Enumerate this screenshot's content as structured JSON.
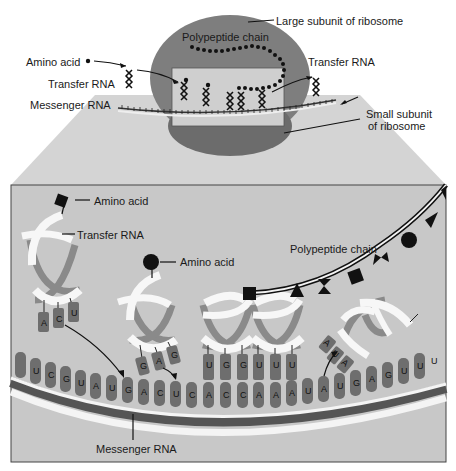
{
  "overview": {
    "labels": {
      "large_subunit": "Large subunit of ribosome",
      "polypeptide_chain": "Polypeptide chain",
      "amino_acid": "Amino acid",
      "transfer_rna_left": "Transfer RNA",
      "transfer_rna_right": "Transfer RNA",
      "messenger_rna": "Messenger RNA",
      "small_subunit_line1": "Small subunit",
      "small_subunit_line2": "of ribosome"
    }
  },
  "detail": {
    "labels": {
      "amino_acid_1": "Amino acid",
      "transfer_rna": "Transfer RNA",
      "amino_acid_2": "Amino acid",
      "polypeptide_chain": "Polypeptide chain",
      "messenger_rna": "Messenger RNA"
    },
    "trna_incoming_1": {
      "anticodon": [
        "A",
        "C",
        "U"
      ],
      "amino_acid_shape": "square"
    },
    "trna_incoming_2": {
      "anticodon": [
        "G",
        "A",
        "G"
      ],
      "amino_acid_shape": "circle"
    },
    "trna_bound_1": {
      "anticodon": [
        "U",
        "G",
        "G"
      ],
      "amino_acid_shape": "square"
    },
    "trna_bound_2": {
      "anticodon": [
        "U",
        "U",
        "U"
      ],
      "amino_acid_shape": "triangle"
    },
    "trna_exiting": {
      "anticodon": [
        "A",
        "U",
        "A"
      ]
    },
    "mrna_bases": [
      "U",
      "C",
      "G",
      "U",
      "A",
      "U",
      "G",
      "A",
      "C",
      "U",
      "C",
      "A",
      "C",
      "C",
      "A",
      "A",
      "A",
      "U",
      "A",
      "U",
      "G",
      "A",
      "G",
      "U",
      "U",
      "U"
    ],
    "polypeptide_residues": [
      "square",
      "triangle",
      "bowtie",
      "square",
      "bowtie",
      "circle",
      "triangle",
      "triangle"
    ]
  },
  "colors": {
    "ribosome": "#7a7a7a",
    "ribosome_dark": "#6a6a6a",
    "panel_bg": "#c9c9c9",
    "funnel": "#d4d4d4",
    "base": "#6e6e6e",
    "trna_white": "#f7f7f7",
    "trna_gray": "#8a8a8a",
    "ink": "#111111"
  }
}
